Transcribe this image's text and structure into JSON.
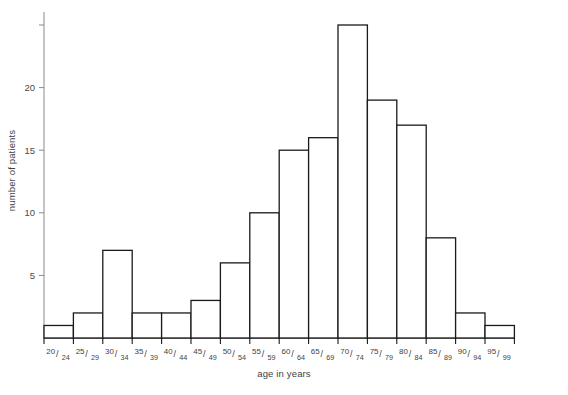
{
  "chart_data": {
    "type": "bar",
    "title": "",
    "xlabel": "age in years",
    "ylabel": "number of patients",
    "categories": [
      "20/24",
      "25/29",
      "30/34",
      "35/39",
      "40/44",
      "45/49",
      "50/54",
      "55/59",
      "60/64",
      "65/69",
      "70/74",
      "75/79",
      "80/84",
      "85/89",
      "90/94",
      "95/99"
    ],
    "category_parts": [
      {
        "num": "20",
        "den": "24"
      },
      {
        "num": "25",
        "den": "29"
      },
      {
        "num": "30",
        "den": "34"
      },
      {
        "num": "35",
        "den": "39"
      },
      {
        "num": "40",
        "den": "44"
      },
      {
        "num": "45",
        "den": "49"
      },
      {
        "num": "50",
        "den": "54"
      },
      {
        "num": "55",
        "den": "59"
      },
      {
        "num": "60",
        "den": "64"
      },
      {
        "num": "65",
        "den": "69"
      },
      {
        "num": "70",
        "den": "74"
      },
      {
        "num": "75",
        "den": "79"
      },
      {
        "num": "80",
        "den": "84"
      },
      {
        "num": "85",
        "den": "89"
      },
      {
        "num": "90",
        "den": "94"
      },
      {
        "num": "95",
        "den": "99"
      }
    ],
    "values": [
      1,
      2,
      7,
      2,
      2,
      3,
      6,
      10,
      15,
      16,
      25,
      19,
      17,
      8,
      2,
      1
    ],
    "ylim": [
      0,
      25.8
    ],
    "yticks": [
      5,
      10,
      15,
      20
    ],
    "ytick_labels": [
      "5",
      "10",
      "15",
      "20"
    ],
    "unlabeled_yticks": [
      25
    ],
    "grid": false,
    "legend": null,
    "bar_edge_color": "#1a1a1a",
    "bar_fill_color": "#ffffff",
    "axis_color": "#8a8a8a"
  }
}
